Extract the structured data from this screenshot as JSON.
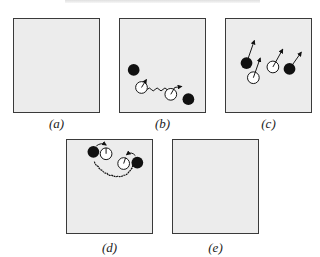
{
  "figure": {
    "header_text": "",
    "colors": {
      "panel_fill": "#ececec",
      "panel_border": "#3a3a3a",
      "black_particle": "#111111",
      "white_particle": "#ffffff",
      "line": "#111111"
    },
    "panels": [
      {
        "id": "a",
        "label": "(a)",
        "content": "empty"
      },
      {
        "id": "b",
        "label": "(b)",
        "content": "two black and two white particles; white particles joined by wavy line; arrows"
      },
      {
        "id": "c",
        "label": "(c)",
        "content": "two black and two white particles with arrows pointing up-right"
      },
      {
        "id": "d",
        "label": "(d)",
        "content": "black-white pairs with curved arrows, joined by wavy arc"
      },
      {
        "id": "e",
        "label": "(e)",
        "content": "empty"
      }
    ]
  }
}
